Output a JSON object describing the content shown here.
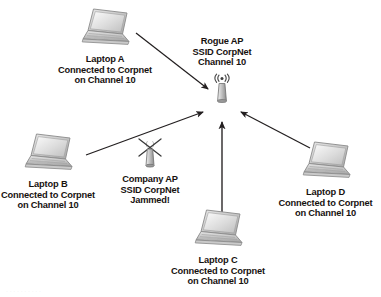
{
  "diagram": {
    "background_color": "#ffffff",
    "line_color": "#231f20",
    "text_color": "#17120f",
    "width": 381,
    "height": 297
  },
  "nodes": {
    "laptop_a": {
      "icon": "laptop-icon",
      "label_lines": [
        "Laptop A",
        "Connected to Corpnet",
        "on Channel 10"
      ],
      "name": "Laptop A",
      "network": "Corpnet",
      "channel": "10"
    },
    "laptop_b": {
      "icon": "laptop-icon",
      "label_lines": [
        "Laptop B",
        "Connected to Corpnet",
        "on Channel 10"
      ],
      "name": "Laptop B",
      "network": "Corpnet",
      "channel": "10"
    },
    "laptop_c": {
      "icon": "laptop-icon",
      "label_lines": [
        "Laptop C",
        "Connected to Corpnet",
        "on Channel 10"
      ],
      "name": "Laptop C",
      "network": "Corpnet",
      "channel": "10"
    },
    "laptop_d": {
      "icon": "laptop-icon",
      "label_lines": [
        "Laptop D",
        "Connected to Corpnet",
        "on Channel 10"
      ],
      "name": "Laptop D",
      "network": "Corpnet",
      "channel": "10"
    },
    "rogue_ap": {
      "icon": "access-point-icon",
      "label_lines": [
        "Rogue AP",
        "SSID CorpNet",
        "Channel 10"
      ],
      "name": "Rogue AP",
      "ssid": "CorpNet",
      "channel": "10",
      "status": "active"
    },
    "company_ap": {
      "icon": "access-point-jammed-icon",
      "label_lines": [
        "Company AP",
        "SSID CorpNet",
        "Jammed!"
      ],
      "name": "Company AP",
      "ssid": "CorpNet",
      "status": "Jammed!"
    }
  },
  "edges": [
    {
      "from": "laptop_a",
      "to": "rogue_ap",
      "direction": "to-rogue-ap"
    },
    {
      "from": "laptop_b",
      "to": "rogue_ap",
      "direction": "to-rogue-ap"
    },
    {
      "from": "laptop_c",
      "to": "rogue_ap",
      "direction": "to-rogue-ap"
    },
    {
      "from": "laptop_d",
      "to": "rogue_ap",
      "direction": "to-rogue-ap"
    }
  ],
  "caption": {
    "faint_text": "· · · · · · · · · ·"
  }
}
